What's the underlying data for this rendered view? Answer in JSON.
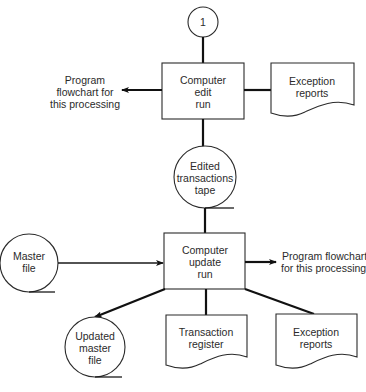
{
  "diagram": {
    "type": "system-flowchart",
    "connector": {
      "label": "1"
    },
    "edit_run": {
      "lines": [
        "Computer",
        "edit",
        "run"
      ]
    },
    "edit_output_left": {
      "lines": [
        "Program",
        "flowchart for",
        "this processing"
      ]
    },
    "edit_exception_report": {
      "lines": [
        "Exception",
        "reports"
      ]
    },
    "edited_tape": {
      "lines": [
        "Edited",
        "transactions",
        "tape"
      ]
    },
    "master_file": {
      "lines": [
        "Master",
        "file"
      ]
    },
    "update_run": {
      "lines": [
        "Computer",
        "update",
        "run"
      ]
    },
    "update_output_right": {
      "lines": [
        "Program flowchart",
        "for this processing"
      ]
    },
    "updated_master_file": {
      "lines": [
        "Updated",
        "master",
        "file"
      ]
    },
    "transaction_register": {
      "lines": [
        "Transaction",
        "register"
      ]
    },
    "update_exception_report": {
      "lines": [
        "Exception",
        "reports"
      ]
    },
    "caption": ""
  }
}
